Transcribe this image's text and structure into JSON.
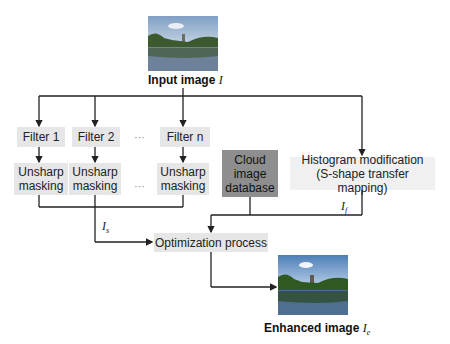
{
  "input": {
    "label": "Input image",
    "symbol": "I"
  },
  "filters": [
    {
      "filter": "Filter 1",
      "unsharp": "Unsharp masking"
    },
    {
      "filter": "Filter 2",
      "unsharp": "Unsharp masking"
    },
    {
      "filter": "Filter n",
      "unsharp": "Unsharp masking"
    }
  ],
  "ellipsis": "···",
  "cloud": {
    "line1": "Cloud",
    "line2": "image",
    "line3": "database"
  },
  "histogram": {
    "line1": "Histogram modification",
    "line2": "(S-shape transfer mapping)"
  },
  "optimization": "Optimization process",
  "symbols": {
    "is": "I",
    "is_sub": "s",
    "if": "I",
    "if_sub": "f"
  },
  "output": {
    "label": "Enhanced image",
    "symbol": "I",
    "sub": "e"
  }
}
